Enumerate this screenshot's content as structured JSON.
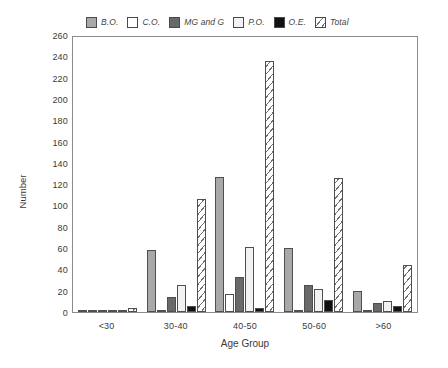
{
  "chart_data": {
    "type": "bar",
    "title": "",
    "xlabel": "Age Group",
    "ylabel": "Number",
    "categories": [
      "<30",
      "30-40",
      "40-50",
      "50-60",
      ">60"
    ],
    "ylim": [
      0,
      260
    ],
    "ytick_step": 20,
    "yticks": [
      260,
      240,
      220,
      200,
      180,
      160,
      140,
      120,
      100,
      80,
      60,
      40,
      20,
      0
    ],
    "grid": false,
    "legend_position": "top",
    "series": [
      {
        "name": "B.O.",
        "fill": "#a8a8a8",
        "values": [
          2,
          58,
          127,
          60,
          20
        ]
      },
      {
        "name": "C.O.",
        "fill": "#ffffff",
        "values": [
          0,
          2,
          17,
          2,
          1
        ]
      },
      {
        "name": "MG and G",
        "fill": "#696969",
        "values": [
          1,
          14,
          33,
          25,
          8
        ]
      },
      {
        "name": "P.O.",
        "fill": "#f2f2f2",
        "values": [
          1,
          25,
          61,
          22,
          10
        ]
      },
      {
        "name": "O.E.",
        "fill": "#111111",
        "values": [
          0,
          6,
          4,
          11,
          6
        ]
      },
      {
        "name": "Total",
        "fill": "hatched",
        "values": [
          4,
          106,
          236,
          126,
          44
        ]
      }
    ]
  },
  "legend": {
    "items": [
      {
        "label": "B.O.",
        "swatch": "bo-swatch-icon"
      },
      {
        "label": "C.O.",
        "swatch": "co-swatch-icon"
      },
      {
        "label": "MG and G",
        "swatch": "mgg-swatch-icon"
      },
      {
        "label": "P.O.",
        "swatch": "po-swatch-icon"
      },
      {
        "label": "O.E.",
        "swatch": "oe-swatch-icon"
      },
      {
        "label": "Total",
        "swatch": "total-swatch-icon"
      }
    ]
  }
}
